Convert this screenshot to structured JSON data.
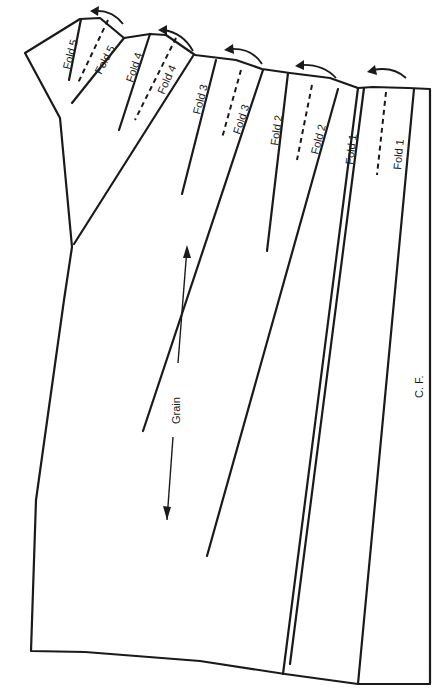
{
  "diagram": {
    "type": "sewing pattern - slash and fold drape",
    "colors": {
      "line": "#1a1a1a",
      "background": "#ffffff"
    },
    "labels": {
      "fold5_a": "Fold 5",
      "fold5_b": "Fold 5",
      "fold4_a": "Fold 4",
      "fold4_b": "Fold 4",
      "fold3_a": "Fold 3",
      "fold3_b": "Fold 3",
      "fold2_a": "Fold 2",
      "fold2_b": "Fold 2",
      "fold1_a": "Fold 1",
      "fold1_b": "Fold 1",
      "grain": "Grain",
      "center_front": "C. F."
    },
    "fold_pairs": [
      {
        "fold": 5,
        "solid_label": "Fold 5",
        "dashed_label": "Fold 5",
        "arrow": "curved-left"
      },
      {
        "fold": 4,
        "solid_label": "Fold 4",
        "dashed_label": "Fold 4",
        "arrow": "curved-left"
      },
      {
        "fold": 3,
        "solid_label": "Fold 3",
        "dashed_label": "Fold 3",
        "arrow": "curved-left"
      },
      {
        "fold": 2,
        "solid_label": "Fold 2",
        "dashed_label": "Fold 2",
        "arrow": "curved-left"
      },
      {
        "fold": 1,
        "solid_label": "Fold 1",
        "dashed_label": "Fold 1",
        "arrow": "curved-left"
      }
    ],
    "grainline": {
      "label": "Grain",
      "direction": "bidirectional-vertical"
    },
    "edge_label": "C. F."
  }
}
